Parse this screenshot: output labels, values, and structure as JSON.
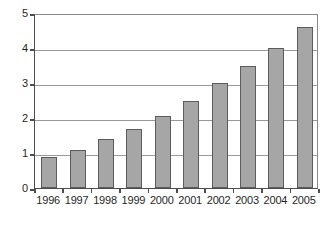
{
  "chart_data": {
    "type": "bar",
    "title": "",
    "subtitle": "",
    "xlabel": "",
    "ylabel": "",
    "categories": [
      "1996",
      "1997",
      "1998",
      "1999",
      "2000",
      "2001",
      "2002",
      "2003",
      "2004",
      "2005"
    ],
    "values": [
      0.9,
      1.1,
      1.4,
      1.7,
      2.05,
      2.5,
      3.0,
      3.5,
      4.0,
      4.6
    ],
    "series": [
      {
        "name": "Series 1",
        "values": [
          0.9,
          1.1,
          1.4,
          1.7,
          2.05,
          2.5,
          3.0,
          3.5,
          4.0,
          4.6
        ]
      }
    ],
    "ylim": [
      0,
      5
    ],
    "ytick_labels": [
      "0",
      "1",
      "2",
      "3",
      "4",
      "5"
    ],
    "ytick_values": [
      0,
      1,
      2,
      3,
      4,
      5
    ],
    "grid": "horizontal",
    "legend": "none",
    "bar_color": "#a6a6a6",
    "bar_border_color": "#5c5c5c",
    "axis_color": "#4d4d4d",
    "gridline_color": "#9a9a9a",
    "background_color": "#ffffff",
    "text_color": "#1f1f1f"
  }
}
